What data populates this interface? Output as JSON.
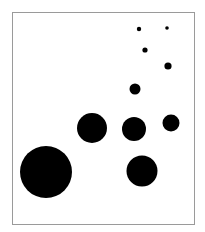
{
  "canvas": {
    "width": 205,
    "height": 232,
    "background": "#ffffff"
  },
  "frame": {
    "x": 12,
    "y": 12,
    "width": 182,
    "height": 212,
    "stroke": "#9a9a9a",
    "stroke_width": 1
  },
  "dot_color": "#000000",
  "dots": [
    {
      "cx": 139,
      "cy": 29,
      "r": 2.2
    },
    {
      "cx": 167,
      "cy": 28,
      "r": 1.8
    },
    {
      "cx": 145,
      "cy": 50,
      "r": 2.6
    },
    {
      "cx": 168,
      "cy": 66,
      "r": 3.6
    },
    {
      "cx": 135,
      "cy": 89,
      "r": 5.5
    },
    {
      "cx": 92,
      "cy": 128,
      "r": 15
    },
    {
      "cx": 134,
      "cy": 129,
      "r": 12
    },
    {
      "cx": 171,
      "cy": 123,
      "r": 8.5
    },
    {
      "cx": 46,
      "cy": 172,
      "r": 26
    },
    {
      "cx": 142,
      "cy": 171,
      "r": 15.5
    }
  ]
}
